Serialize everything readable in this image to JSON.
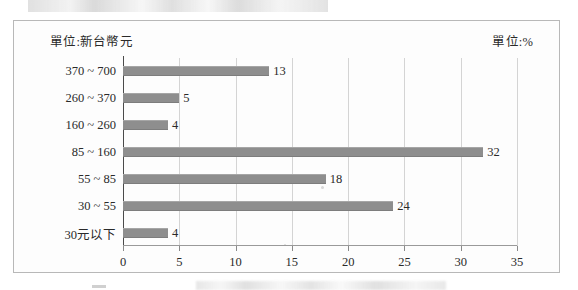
{
  "figure": {
    "unit_left": "單位:新台幣元",
    "unit_right": "單位:%"
  },
  "chart_data": {
    "type": "bar",
    "orientation": "horizontal",
    "title": "",
    "xlabel": "",
    "ylabel": "",
    "xlim": [
      0,
      35
    ],
    "xticks": [
      "0",
      "5",
      "10",
      "15",
      "20",
      "25",
      "30",
      "35"
    ],
    "grid": "vertical",
    "legend": "none",
    "bar_color": "#8e8e8e",
    "categories": [
      "370 ~ 700",
      "260 ~ 370",
      "160 ~ 260",
      "85 ~ 160",
      "55 ~ 85",
      "30 ~ 55",
      "30元以下"
    ],
    "values": [
      13,
      5,
      4,
      32,
      18,
      24,
      4
    ],
    "value_labels": [
      "13",
      "5",
      "4",
      "32",
      "18",
      "24",
      "4"
    ],
    "unit_x": "%",
    "unit_y": "新台幣元"
  }
}
